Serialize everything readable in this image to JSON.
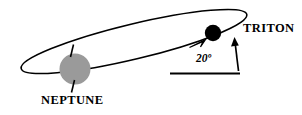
{
  "figure": {
    "type": "astronomy-orbit-diagram",
    "background_color": "#ffffff",
    "stroke_color": "#000000",
    "planet_fill_color": "#9a9a9a",
    "moon_fill_color": "#000000",
    "labels": {
      "planet": "NEPTUNE",
      "moon": "TRITON",
      "angle": "20º"
    },
    "annotations": {
      "angle_value": "20",
      "angle_unit": "degrees",
      "orbit_direction_marker": "arrowhead",
      "reference_line": "horizontal",
      "pointer_to_moon": "vertical-arrow",
      "pole_axis_ticks": 2
    }
  }
}
